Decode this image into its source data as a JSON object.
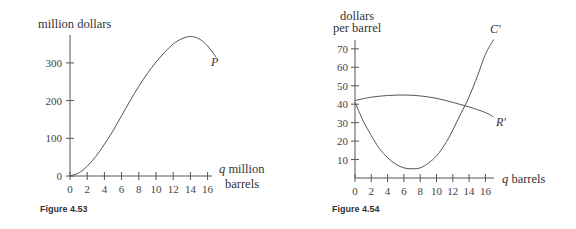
{
  "chart_data": [
    {
      "type": "line",
      "figure_caption": "Figure 4.53",
      "ylabel": "million dollars",
      "xlabel_var": "q",
      "xlabel": "million barrels",
      "xticks": [
        0,
        2,
        4,
        6,
        8,
        10,
        12,
        14,
        16
      ],
      "yticks": [
        0,
        100,
        200,
        300
      ],
      "xlim": [
        0,
        17
      ],
      "ylim": [
        0,
        380
      ],
      "grid": false,
      "series": [
        {
          "name": "P",
          "x": [
            0,
            1,
            2,
            3,
            4,
            5,
            6,
            7,
            8,
            9,
            10,
            11,
            12,
            13,
            14,
            15,
            16,
            17
          ],
          "values": [
            0,
            8,
            26,
            52,
            84,
            120,
            160,
            200,
            238,
            272,
            302,
            328,
            350,
            364,
            370,
            364,
            345,
            315
          ]
        }
      ]
    },
    {
      "type": "line",
      "figure_caption": "Figure 4.54",
      "ylabel": "dollars per barrel",
      "ylabel_line1": "dollars",
      "ylabel_line2": "per barrel",
      "xlabel_var": "q",
      "xlabel": "barrels",
      "xticks": [
        0,
        2,
        4,
        6,
        8,
        10,
        12,
        14,
        16
      ],
      "yticks": [
        10,
        20,
        30,
        40,
        50,
        60,
        70
      ],
      "xlim": [
        0,
        17
      ],
      "ylim": [
        0,
        75
      ],
      "grid": false,
      "series": [
        {
          "name": "C'",
          "x": [
            0,
            1,
            2,
            3,
            4,
            5,
            6,
            7,
            8,
            9,
            10,
            11,
            12,
            13,
            14,
            15,
            16,
            17
          ],
          "values": [
            41,
            31,
            23,
            16,
            11,
            7.5,
            5.5,
            5,
            5.5,
            8,
            12,
            18,
            26,
            35,
            44,
            55,
            67,
            75
          ]
        },
        {
          "name": "R'",
          "x": [
            0,
            2,
            4,
            6,
            8,
            10,
            12,
            14,
            16,
            17
          ],
          "values": [
            42,
            43.8,
            44.7,
            45,
            44.5,
            43.2,
            41,
            38.5,
            35.5,
            33
          ]
        }
      ]
    }
  ],
  "labels": {
    "fig1": {
      "ylabel": "million dollars",
      "xlabel_line1": "q million",
      "xlabel_q": "q",
      "xlabel_rest1": " million",
      "xlabel_line2": "barrels",
      "curve": "P",
      "caption": "Figure 4.53",
      "xticks": [
        "0",
        "2",
        "4",
        "6",
        "8",
        "10",
        "12",
        "14",
        "16"
      ],
      "yticks": [
        "0",
        "100",
        "200",
        "300"
      ]
    },
    "fig2": {
      "ylabel_line1": "dollars",
      "ylabel_line2": "per barrel",
      "xlabel_q": "q",
      "xlabel_rest": " barrels",
      "curve_c": "C'",
      "curve_r": "R'",
      "caption": "Figure 4.54",
      "xticks": [
        "0",
        "2",
        "4",
        "6",
        "8",
        "10",
        "12",
        "14",
        "16"
      ],
      "yticks": [
        "10",
        "20",
        "30",
        "40",
        "50",
        "60",
        "70"
      ]
    }
  }
}
